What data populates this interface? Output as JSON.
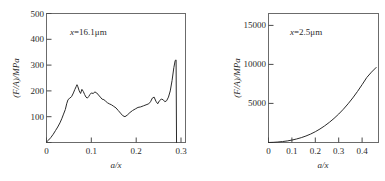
{
  "figure": {
    "background": "#ffffff",
    "curve_color": "#2b2b2b",
    "axis_color": "#4a4a4a"
  },
  "chart_data": [
    {
      "type": "line",
      "id": "left",
      "title": "",
      "annotation": "x=16.1μm",
      "annotation_var": "x",
      "annotation_rest": "=16.1μm",
      "xlabel": "a/x",
      "ylabel": "(F/A)/MPa",
      "xlim": [
        0,
        0.31
      ],
      "ylim": [
        0,
        500
      ],
      "xticks": [
        0,
        0.1,
        0.2,
        0.3
      ],
      "xticklabels": [
        "0",
        "0.1",
        "0.2",
        "0.3"
      ],
      "yticks": [
        0,
        100,
        200,
        300,
        400,
        500
      ],
      "yticklabels": [
        "0",
        "100",
        "200",
        "300",
        "400",
        "500"
      ],
      "grid": false,
      "legend": "none",
      "x": [
        0.0,
        0.005,
        0.01,
        0.015,
        0.02,
        0.025,
        0.03,
        0.034,
        0.038,
        0.042,
        0.045,
        0.048,
        0.052,
        0.056,
        0.06,
        0.063,
        0.066,
        0.068,
        0.07,
        0.073,
        0.076,
        0.079,
        0.082,
        0.085,
        0.088,
        0.091,
        0.094,
        0.097,
        0.1,
        0.104,
        0.108,
        0.112,
        0.116,
        0.12,
        0.124,
        0.128,
        0.132,
        0.136,
        0.14,
        0.145,
        0.15,
        0.155,
        0.16,
        0.165,
        0.17,
        0.175,
        0.18,
        0.186,
        0.192,
        0.198,
        0.204,
        0.21,
        0.216,
        0.222,
        0.228,
        0.232,
        0.236,
        0.24,
        0.244,
        0.248,
        0.252,
        0.256,
        0.26,
        0.264,
        0.268,
        0.272,
        0.276,
        0.28,
        0.284,
        0.287,
        0.289,
        0.29
      ],
      "values": [
        2,
        10,
        20,
        32,
        46,
        60,
        76,
        92,
        110,
        128,
        150,
        166,
        172,
        178,
        192,
        205,
        216,
        224,
        216,
        200,
        190,
        206,
        198,
        186,
        176,
        172,
        178,
        186,
        192,
        190,
        196,
        192,
        184,
        176,
        168,
        166,
        160,
        154,
        150,
        146,
        140,
        134,
        124,
        114,
        104,
        100,
        106,
        116,
        124,
        130,
        136,
        138,
        142,
        146,
        150,
        158,
        172,
        176,
        160,
        150,
        162,
        168,
        166,
        158,
        162,
        176,
        200,
        240,
        290,
        318,
        320,
        0
      ]
    },
    {
      "type": "line",
      "id": "right",
      "title": "",
      "annotation": "x=2.5μm",
      "annotation_var": "x",
      "annotation_rest": "=2.5μm",
      "xlabel": "a/x",
      "ylabel": "(F/A)/MPa",
      "xlim": [
        0,
        0.47
      ],
      "ylim": [
        0,
        16500
      ],
      "xticks": [
        0,
        0.1,
        0.2,
        0.3,
        0.4
      ],
      "xticklabels": [
        "0",
        "0.1",
        "0.2",
        "0.3",
        "0.4"
      ],
      "yticks": [
        0,
        5000,
        10000,
        15000
      ],
      "yticklabels": [
        "0",
        "5000",
        "10000",
        "15000"
      ],
      "grid": false,
      "legend": "none",
      "x": [
        0.0,
        0.02,
        0.04,
        0.06,
        0.08,
        0.1,
        0.12,
        0.14,
        0.16,
        0.18,
        0.2,
        0.22,
        0.24,
        0.26,
        0.28,
        0.3,
        0.32,
        0.34,
        0.36,
        0.38,
        0.4,
        0.42,
        0.44,
        0.46
      ],
      "values": [
        0,
        20,
        60,
        120,
        200,
        310,
        450,
        620,
        830,
        1080,
        1380,
        1730,
        2130,
        2580,
        3080,
        3640,
        4260,
        4950,
        5700,
        6520,
        7400,
        8320,
        9000,
        9600
      ]
    }
  ]
}
